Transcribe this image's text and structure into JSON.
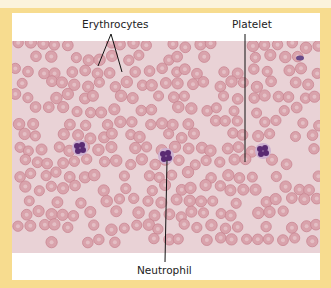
{
  "figure": {
    "labels": {
      "erythrocytes": "Erythrocytes",
      "platelet": "Platelet",
      "neutrophil": "Neutrophil"
    },
    "colors": {
      "border": "#f7dc8f",
      "panel": "#ffffff",
      "background_plasma": "#e9d2d6",
      "erythrocyte": "#d9a3ac",
      "erythrocyte_edge": "#c98592",
      "nucleus": "#5a2a72",
      "leader_line": "#111111"
    },
    "cells": {
      "neutrophils": [
        {
          "x": 80,
          "y": 148
        },
        {
          "x": 166,
          "y": 156
        },
        {
          "x": 263,
          "y": 151
        }
      ],
      "platelet_blob": {
        "x": 300,
        "y": 58
      }
    }
  }
}
